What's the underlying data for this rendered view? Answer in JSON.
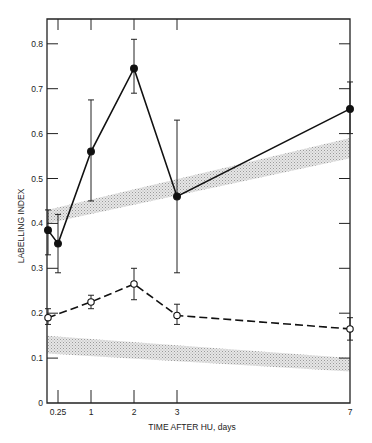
{
  "chart_data": {
    "type": "line",
    "title": "",
    "xlabel": "TIME AFTER HU, days",
    "ylabel": "LABELLING INDEX",
    "xlim": [
      0,
      7
    ],
    "ylim": [
      0,
      0.85
    ],
    "grid": false,
    "legend": null,
    "x_ticks": [
      {
        "value": 0.25,
        "label": "0.25"
      },
      {
        "value": 1,
        "label": "1"
      },
      {
        "value": 2,
        "label": "2"
      },
      {
        "value": 3,
        "label": "3"
      },
      {
        "value": 7,
        "label": "7"
      }
    ],
    "y_ticks": [
      {
        "value": 0,
        "label": "0"
      },
      {
        "value": 0.1,
        "label": "0.1"
      },
      {
        "value": 0.2,
        "label": "0.2"
      },
      {
        "value": 0.3,
        "label": "0.3"
      },
      {
        "value": 0.4,
        "label": "0.4"
      },
      {
        "value": 0.5,
        "label": "0.5"
      },
      {
        "value": 0.6,
        "label": "0.6"
      },
      {
        "value": 0.7,
        "label": "0.7"
      },
      {
        "value": 0.8,
        "label": "0.8"
      }
    ],
    "series": [
      {
        "name": "filled circles (solid line)",
        "marker": "filled-circle",
        "line": "solid",
        "x": [
          0,
          0.25,
          1,
          2,
          3,
          7
        ],
        "values": [
          0.385,
          0.355,
          0.56,
          0.745,
          0.46,
          0.655
        ],
        "err_low": [
          0.33,
          0.29,
          0.45,
          0.69,
          0.29,
          0.6
        ],
        "err_high": [
          0.43,
          0.42,
          0.675,
          0.81,
          0.63,
          0.715
        ]
      },
      {
        "name": "open circles (dashed line)",
        "marker": "open-circle",
        "line": "dashed",
        "x": [
          0,
          1,
          2,
          3,
          7
        ],
        "values": [
          0.19,
          0.225,
          0.265,
          0.195,
          0.165
        ],
        "err_low": [
          0.175,
          0.21,
          0.23,
          0.175,
          0.14
        ],
        "err_high": [
          0.21,
          0.24,
          0.3,
          0.22,
          0.19
        ]
      }
    ],
    "bands": [
      {
        "name": "upper shaded band",
        "x": [
          0,
          7
        ],
        "low": [
          0.4,
          0.545
        ],
        "high": [
          0.43,
          0.59
        ]
      },
      {
        "name": "lower shaded band",
        "x": [
          0,
          7
        ],
        "low": [
          0.11,
          0.07
        ],
        "high": [
          0.15,
          0.1
        ]
      }
    ]
  }
}
